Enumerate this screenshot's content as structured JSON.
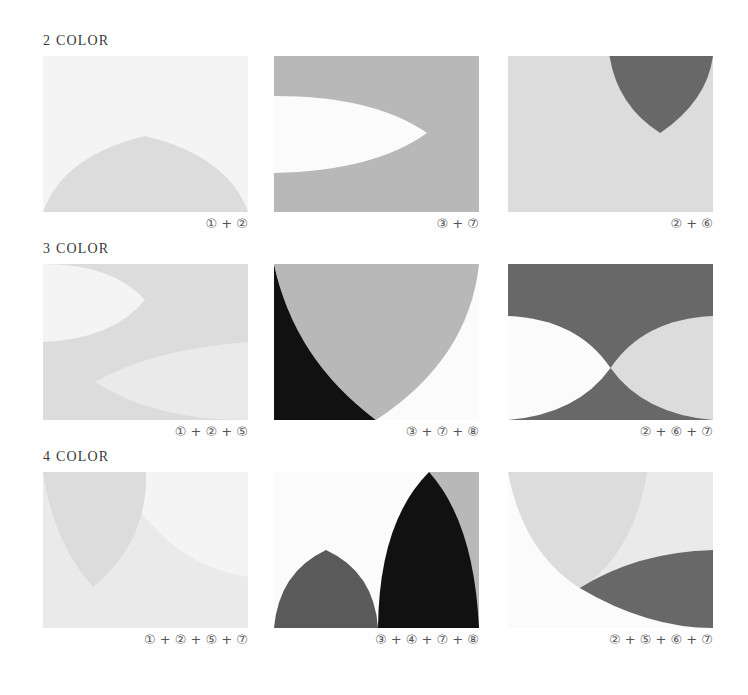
{
  "colors": {
    "c1": "#f4f4f4",
    "c2": "#dcdcdc",
    "c3": "#b8b8b8",
    "c4": "#5a5a5a",
    "c5": "#eaeaea",
    "c6": "#686868",
    "c7": "#fbfbfb",
    "c8": "#111111"
  },
  "rows": [
    {
      "title": "2 COLOR",
      "panels": [
        {
          "caption": "① + ②"
        },
        {
          "caption": "③ + ⑦"
        },
        {
          "caption": "② + ⑥"
        }
      ]
    },
    {
      "title": "3 COLOR",
      "panels": [
        {
          "caption": "① + ② + ⑤"
        },
        {
          "caption": "③ + ⑦ + ⑧"
        },
        {
          "caption": "② + ⑥ + ⑦"
        }
      ]
    },
    {
      "title": "4 COLOR",
      "panels": [
        {
          "caption": "① + ② + ⑤ + ⑦"
        },
        {
          "caption": "③ + ④ + ⑦ + ⑧"
        },
        {
          "caption": "② + ⑤ + ⑥ + ⑦"
        }
      ]
    }
  ]
}
